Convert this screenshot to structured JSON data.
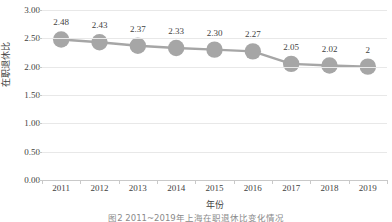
{
  "chart_data": {
    "type": "line",
    "title": "",
    "subtitle": "",
    "xlabel": "年份",
    "ylabel": "在职退休比",
    "categories": [
      "2011",
      "2012",
      "2013",
      "2014",
      "2015",
      "2016",
      "2017",
      "2018",
      "2019"
    ],
    "values": [
      2.48,
      2.43,
      2.37,
      2.33,
      2.3,
      2.27,
      2.05,
      2.02,
      2.0
    ],
    "data_labels": [
      "2.48",
      "2.43",
      "2.37",
      "2.33",
      "2.30",
      "2.27",
      "2.05",
      "2.02",
      "2"
    ],
    "series": [
      {
        "name": "在职退休比",
        "values": [
          2.48,
          2.43,
          2.37,
          2.33,
          2.3,
          2.27,
          2.05,
          2.02,
          2.0
        ]
      }
    ],
    "ylim": [
      0.0,
      3.0
    ],
    "ytick_labels": [
      "0.00",
      "0.50",
      "1.00",
      "1.50",
      "2.00",
      "2.50",
      "3.00"
    ],
    "ytick_values": [
      0.0,
      0.5,
      1.0,
      1.5,
      2.0,
      2.5,
      3.0
    ],
    "grid": true,
    "grid_axis": "y",
    "legend": false,
    "legend_position": "none",
    "marker": "circle",
    "marker_color": "#a6a6a6",
    "line_color": "#a6a6a6",
    "grid_color": "#e8e8e8",
    "axis_color": "#c9c9c9",
    "text_color": "#3f3f3f"
  },
  "caption": {
    "text": "图2   2011~2019年上海在职退休比变化情况"
  }
}
